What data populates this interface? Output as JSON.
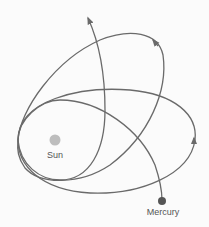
{
  "diagram": {
    "labels": {
      "sun": "Sun",
      "mercury": "Mercury"
    },
    "colors": {
      "background": "#fbfbfb",
      "orbit_stroke": "#6a6a6a",
      "sun_fill": "#bdbdbd",
      "mercury_fill": "#555555",
      "label_text": "#555555"
    },
    "icons": {
      "orbit_arrow": "arrowhead"
    }
  }
}
